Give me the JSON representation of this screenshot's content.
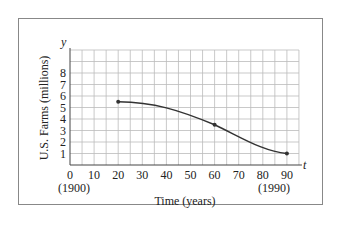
{
  "chart_data": {
    "type": "line",
    "title": "",
    "xlabel": "Time (years)",
    "ylabel": "U.S. Farms (millions)",
    "x_axis_var": "t",
    "y_axis_var": "y",
    "xlim": [
      0,
      95
    ],
    "ylim": [
      0,
      10
    ],
    "x_ticks": [
      0,
      10,
      20,
      30,
      40,
      50,
      60,
      70,
      80,
      90
    ],
    "y_ticks": [
      1,
      2,
      3,
      4,
      5,
      6,
      7,
      8
    ],
    "x_tick_sublabels": {
      "0": "(1900)",
      "90": "(1990)"
    },
    "grid": true,
    "series": [
      {
        "name": "U.S. Farms",
        "points": [
          [
            20,
            5.5
          ],
          [
            60,
            3.5
          ],
          [
            90,
            1.0
          ]
        ],
        "marked_points": [
          [
            20,
            5.5
          ],
          [
            60,
            3.5
          ],
          [
            90,
            1.0
          ]
        ]
      }
    ]
  },
  "labels": {
    "xlabel": "Time (years)",
    "ylabel": "U.S. Farms (millions)",
    "x_var": "t",
    "y_var": "y",
    "sub_1900": "(1900)",
    "sub_1990": "(1990)"
  }
}
